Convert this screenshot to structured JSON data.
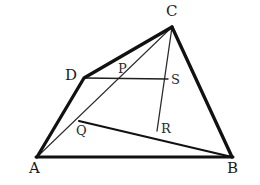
{
  "figure": {
    "background_color": "#ffffff",
    "stroke_color": "#111111",
    "label_color": "#1a1a1a",
    "width": 260,
    "height": 185,
    "points": {
      "A": {
        "label": "A",
        "x": 37,
        "y": 157,
        "label_x": 29,
        "label_y": 161
      },
      "B": {
        "label": "B",
        "x": 232,
        "y": 157,
        "label_x": 228,
        "label_y": 161
      },
      "C": {
        "label": "C",
        "x": 172,
        "y": 27,
        "label_x": 166,
        "label_y": 6
      },
      "D": {
        "label": "D",
        "x": 84,
        "y": 78,
        "label_x": 66,
        "label_y": 69
      },
      "P": {
        "label": "P",
        "x": 120,
        "y": 80,
        "label_x": 119,
        "label_y": 62
      },
      "S": {
        "label": "S",
        "x": 167,
        "y": 79,
        "label_x": 170,
        "label_y": 74
      },
      "Q": {
        "label": "Q",
        "x": 80,
        "y": 122,
        "label_x": 77,
        "label_y": 124
      },
      "R": {
        "label": "R",
        "x": 158,
        "y": 129,
        "label_x": 161,
        "label_y": 122
      }
    },
    "segments": [
      {
        "name": "segment-A-D",
        "from": "A",
        "to": "D",
        "weight": "thick",
        "width": 3.2
      },
      {
        "name": "segment-D-C",
        "from": "D",
        "to": "C",
        "weight": "thick",
        "width": 3.2
      },
      {
        "name": "segment-C-B",
        "from": "C",
        "to": "B",
        "weight": "thick",
        "width": 3.2
      },
      {
        "name": "segment-A-B",
        "from": "A",
        "to": "B",
        "weight": "thick",
        "width": 3.0
      },
      {
        "name": "segment-Q-B",
        "from": "Q",
        "to": "B",
        "weight": "medium",
        "width": 2.2
      },
      {
        "name": "segment-A-C-cevian",
        "from": "A",
        "to": "C",
        "weight": "thin",
        "width": 1.1
      },
      {
        "name": "segment-D-S",
        "from": "D",
        "to": "S",
        "weight": "thin",
        "width": 1.4
      },
      {
        "name": "segment-C-R",
        "from": "C",
        "to": "R",
        "weight": "thin",
        "width": 1.3
      }
    ]
  }
}
